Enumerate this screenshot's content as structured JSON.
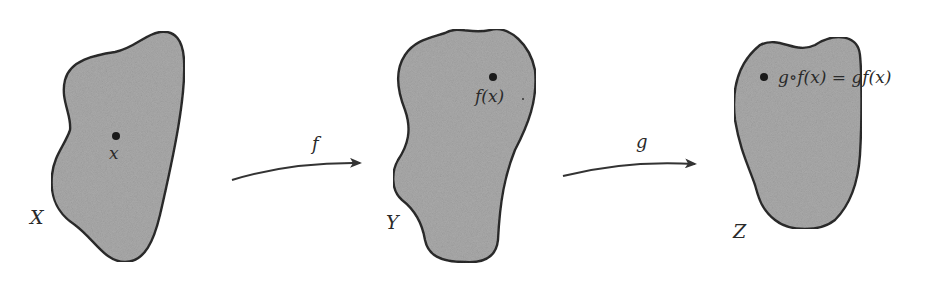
{
  "diagram": {
    "sets": [
      {
        "id": "X",
        "label": "X",
        "point_label": "x"
      },
      {
        "id": "Y",
        "label": "Y",
        "point_label": "f(x)"
      },
      {
        "id": "Z",
        "label": "Z",
        "point_label": "g∘f(x) = gf(x)"
      }
    ],
    "arrows": [
      {
        "from": "X",
        "to": "Y",
        "label": "f"
      },
      {
        "from": "Y",
        "to": "Z",
        "label": "g"
      }
    ],
    "colors": {
      "fill": "#a9a9a9",
      "stroke": "#2b2b2b",
      "point": "#1a1a1a",
      "arrow": "#333333"
    }
  }
}
